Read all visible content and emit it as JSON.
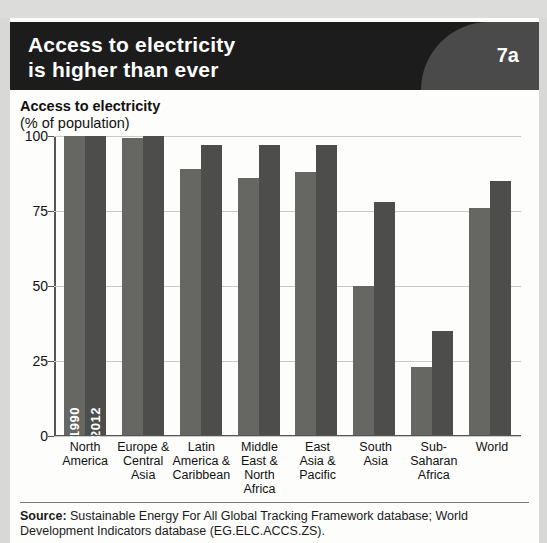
{
  "banner": {
    "title": "Access to electricity\nis higher than ever",
    "figure_number": "7a",
    "background_color": "#1c1c1c",
    "wedge_color": "#4a4a4a"
  },
  "source": {
    "label": "Source:",
    "text": " Sustainable Energy For All Global Tracking Framework database; World Development Indicators database (EG.ELC.ACCS.ZS)."
  },
  "chart_data": {
    "type": "bar",
    "title": "Access to electricity",
    "subtitle": "(% of population)",
    "xlabel": "",
    "ylabel": "",
    "ylim": [
      0,
      100
    ],
    "yticks": [
      "0",
      "25",
      "50",
      "75",
      "100"
    ],
    "grid": true,
    "legend_position": "inside-first-group-rotated",
    "categories": [
      "North\nAmerica",
      "Europe &\nCentral\nAsia",
      "Latin\nAmerica &\nCaribbean",
      "Middle\nEast &\nNorth\nAfrica",
      "East\nAsia &\nPacific",
      "South\nAsia",
      "Sub-\nSaharan\nAfrica",
      "World"
    ],
    "series": [
      {
        "name": "1990",
        "color": "#666663",
        "values": [
          100,
          99.5,
          89,
          86,
          88,
          50,
          23,
          76
        ]
      },
      {
        "name": "2012",
        "color": "#4d4d4b",
        "values": [
          100,
          100,
          97,
          97,
          97,
          78,
          35,
          85
        ]
      }
    ]
  }
}
